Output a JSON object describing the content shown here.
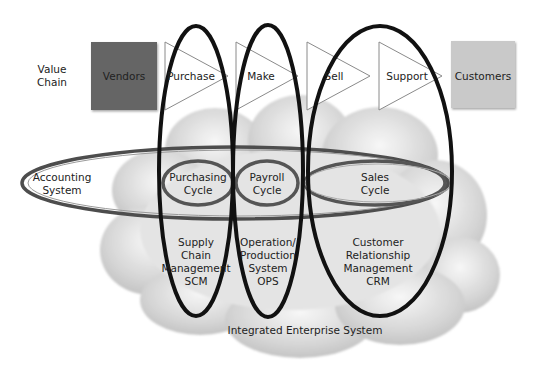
{
  "value_chain": {
    "label_lines": [
      "Value",
      "Chain"
    ],
    "start": {
      "label": "Vendors",
      "fill": "#656565"
    },
    "stages": [
      {
        "label": "Purchase"
      },
      {
        "label": "Make"
      },
      {
        "label": "Sell"
      },
      {
        "label": "Support"
      }
    ],
    "end": {
      "label": "Customers",
      "fill": "#c9c9c9"
    }
  },
  "accounting": {
    "label_lines": [
      "Accounting",
      "System"
    ],
    "cycles": [
      {
        "label_lines": [
          "Purchasing",
          "Cycle"
        ]
      },
      {
        "label_lines": [
          "Payroll",
          "Cycle"
        ]
      },
      {
        "label_lines": [
          "Sales",
          "Cycle"
        ]
      }
    ],
    "ring_color": "#555555"
  },
  "systems": [
    {
      "label_lines": [
        "Supply",
        "Chain",
        "Management",
        "SCM"
      ]
    },
    {
      "label_lines": [
        "Operation/",
        "Production",
        "System",
        "OPS"
      ]
    },
    {
      "label_lines": [
        "Customer",
        "Relationship",
        "Management",
        "CRM"
      ]
    }
  ],
  "cloud": {
    "label": "Integrated Enterprise System"
  },
  "colors": {
    "outline_black": "#111111",
    "cloud_gray": "#d9d9d9"
  }
}
